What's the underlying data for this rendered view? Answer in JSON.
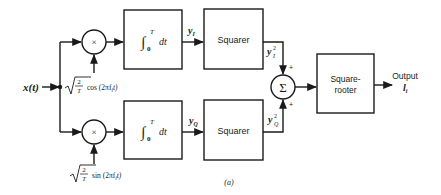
{
  "diagram": {
    "caption": "(a)",
    "input": {
      "label": "x(t)"
    },
    "upper_branch": {
      "multiplier_symbol": "×",
      "reference_prefix": "cos (2πf",
      "reference_sub": "i",
      "reference_suffix": "t)",
      "integrator": {
        "integral": "∫",
        "upper": "T",
        "lower": "0",
        "body": "dt"
      },
      "integrator_output": {
        "base": "y",
        "sub": "I"
      },
      "squarer_label": "Squarer",
      "squarer_output": {
        "base": "y",
        "sup": "2",
        "sub": "I"
      },
      "sum_sign": "+"
    },
    "lower_branch": {
      "multiplier_symbol": "×",
      "reference_prefix": "sin (2πf",
      "reference_sub": "i",
      "reference_suffix": "t)",
      "integrator": {
        "integral": "∫",
        "upper": "T",
        "lower": "0",
        "body": "dt"
      },
      "integrator_output": {
        "base": "y",
        "sub": "Q"
      },
      "squarer_label": "Squarer",
      "squarer_output": {
        "base": "y",
        "sup": "2",
        "sub": "Q"
      },
      "sum_sign": "+"
    },
    "sqrt_coefficient": {
      "num": "2",
      "den": "T"
    },
    "summer_symbol": "Σ",
    "square_rooter": {
      "line1": "Square-",
      "line2": "rooter"
    },
    "output": {
      "label": "Output",
      "base": "l",
      "sub": "i"
    }
  }
}
